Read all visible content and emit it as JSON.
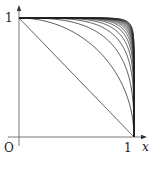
{
  "chart_data": {
    "type": "line",
    "title": "",
    "xlabel": "x",
    "ylabel": "",
    "origin_label": "O",
    "x_ticks": [
      "1"
    ],
    "y_ticks": [
      "1"
    ],
    "xlim": [
      0,
      1.08
    ],
    "ylim": [
      0,
      1.08
    ],
    "grid": false,
    "legend": null,
    "series_exponents": [
      1,
      2,
      3,
      4,
      5,
      6,
      7,
      8,
      9,
      10,
      11,
      12,
      13,
      14,
      15,
      16
    ],
    "series_formula": "y = (1 - x^p)^(1/p)",
    "line_color": "#222222"
  },
  "labels": {
    "origin": "O",
    "x_tick_1": "1",
    "y_tick_1": "1",
    "x_axis": "x"
  }
}
